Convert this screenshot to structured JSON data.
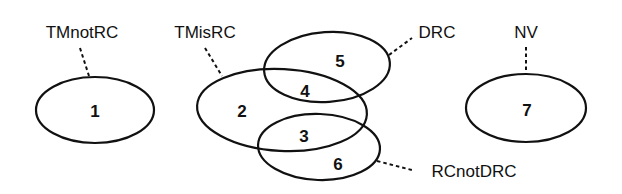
{
  "diagram": {
    "type": "venn",
    "colors": {
      "stroke": "#111111",
      "text": "#111111",
      "background": "#ffffff"
    },
    "sets": [
      {
        "id": "tmnotrc",
        "label": "TMnotRC"
      },
      {
        "id": "tmisrc",
        "label": "TMisRC"
      },
      {
        "id": "drc",
        "label": "DRC"
      },
      {
        "id": "nv",
        "label": "NV"
      },
      {
        "id": "rcnotdrc",
        "label": "RCnotDRC"
      }
    ],
    "regions": [
      {
        "number": "1",
        "in_sets": [
          "TMnotRC"
        ]
      },
      {
        "number": "2",
        "in_sets": [
          "TMisRC"
        ]
      },
      {
        "number": "3",
        "in_sets": [
          "TMisRC",
          "RCnotDRC"
        ]
      },
      {
        "number": "4",
        "in_sets": [
          "TMisRC",
          "DRC"
        ]
      },
      {
        "number": "5",
        "in_sets": [
          "DRC"
        ]
      },
      {
        "number": "6",
        "in_sets": [
          "RCnotDRC"
        ]
      },
      {
        "number": "7",
        "in_sets": [
          "NV"
        ]
      }
    ]
  }
}
